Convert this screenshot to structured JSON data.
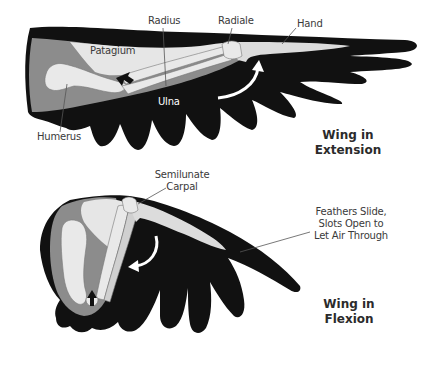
{
  "figure": {
    "colors": {
      "feathers": "#111111",
      "skin": "#8c8c8c",
      "bone": "#e3e3e3",
      "patagium": "#e8e8e8",
      "leader_line": "#555555",
      "text": "#3a3a3a"
    },
    "extension": {
      "title_line1": "Wing in",
      "title_line2": "Extension",
      "labels": {
        "radius": "Radius",
        "radiale": "Radiale",
        "hand": "Hand",
        "patagium": "Patagium",
        "ulna": "Ulna",
        "humerus": "Humerus"
      },
      "arrows": [
        "curved-arrow-up",
        "joint-arrow"
      ]
    },
    "flexion": {
      "title_line1": "Wing in",
      "title_line2": "Flexion",
      "labels": {
        "semilunate_line1": "Semilunate",
        "semilunate_line2": "Carpal",
        "feathers_line1": "Feathers Slide,",
        "feathers_line2": "Slots Open to",
        "feathers_line3": "Let Air Through"
      },
      "arrows": [
        "curved-arrow-left",
        "joint-arrow"
      ]
    }
  }
}
